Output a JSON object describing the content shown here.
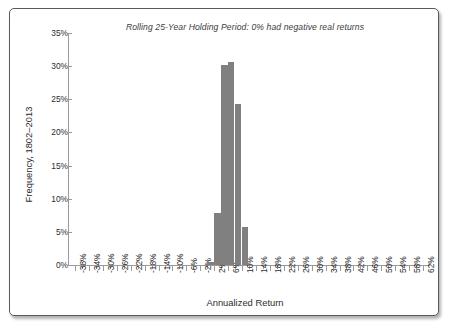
{
  "figure": {
    "title": "Rolling 25-Year Holding Period: 0% had negative real returns",
    "x_axis_title": "Annualized Return",
    "y_axis_title": "Frequency, 1802–2013"
  },
  "colors": {
    "bar_fill": "#808080",
    "axis_line": "#9a9a9a",
    "text": "#2c2c2c",
    "title_text": "#3b3b3b",
    "frame_border": "#5a5a5a",
    "background": "#ffffff"
  },
  "chart_data": {
    "type": "bar",
    "title": "Rolling 25-Year Holding Period: 0% had negative real returns",
    "xlabel": "Annualized Return",
    "ylabel": "Frequency, 1802–2013",
    "xlim": [
      -40,
      64
    ],
    "ylim": [
      0,
      35
    ],
    "ytick_values": [
      0,
      5,
      10,
      15,
      20,
      25,
      30,
      35
    ],
    "ytick_labels": [
      "0%",
      "5%",
      "10%",
      "15%",
      "20%",
      "25%",
      "30%",
      "35%"
    ],
    "xtick_values": [
      -38,
      -34,
      -30,
      -26,
      -22,
      -18,
      -14,
      -10,
      -6,
      -2,
      2,
      6,
      10,
      14,
      18,
      22,
      26,
      30,
      34,
      38,
      42,
      46,
      50,
      54,
      58,
      62
    ],
    "xtick_labels": [
      "-38%",
      "-34%",
      "-30%",
      "-26%",
      "-22%",
      "-18%",
      "-14%",
      "-10%",
      "-6%",
      "-2%",
      "2%",
      "6%",
      "10%",
      "14%",
      "18%",
      "22%",
      "26%",
      "30%",
      "34%",
      "38%",
      "42%",
      "46%",
      "50%",
      "54%",
      "58%",
      "62%"
    ],
    "minor_tick_step": 2,
    "grid": false,
    "legend": null,
    "bin_width": 2,
    "categories": [
      "2%",
      "4%",
      "6%",
      "8%",
      "10%",
      "12%"
    ],
    "x": [
      2,
      4,
      6,
      8,
      10,
      12
    ],
    "values": [
      0.5,
      7.9,
      30.2,
      30.7,
      24.3,
      5.7
    ],
    "series": [
      {
        "name": "Frequency",
        "values": [
          0.5,
          7.9,
          30.2,
          30.7,
          24.3,
          5.7
        ]
      }
    ],
    "annotation": "0% had negative real returns"
  }
}
